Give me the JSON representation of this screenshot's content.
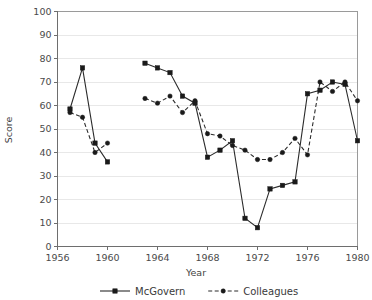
{
  "chart_data": {
    "type": "line",
    "title": "",
    "xlabel": "Year",
    "ylabel": "Score",
    "xlim": [
      1956,
      1980
    ],
    "ylim": [
      0,
      100
    ],
    "xticks": [
      1956,
      1960,
      1964,
      1968,
      1972,
      1976,
      1980
    ],
    "yticks": [
      0,
      10,
      20,
      30,
      40,
      50,
      60,
      70,
      80,
      90,
      100
    ],
    "grid": true,
    "legend_position": "bottom",
    "series": [
      {
        "name": "McGovern",
        "style": "solid",
        "marker": "square",
        "color": "#1a1a1a",
        "segments": [
          {
            "x": [
              1957,
              1958,
              1959,
              1960
            ],
            "y": [
              58.5,
              76,
              44,
              36
            ]
          },
          {
            "x": [
              1963,
              1964,
              1965,
              1966,
              1967,
              1968,
              1969,
              1970,
              1971,
              1972,
              1973,
              1974,
              1975,
              1976,
              1977,
              1978,
              1979,
              1980
            ],
            "y": [
              78,
              76,
              74,
              64,
              61,
              38,
              41,
              45,
              12,
              8,
              24.5,
              26,
              27.5,
              65,
              66.5,
              70,
              69,
              45
            ]
          }
        ]
      },
      {
        "name": "Colleagues",
        "style": "dashed",
        "marker": "circle",
        "color": "#1a1a1a",
        "segments": [
          {
            "x": [
              1957,
              1958,
              1959,
              1960
            ],
            "y": [
              57,
              55,
              40,
              44
            ]
          },
          {
            "x": [
              1963,
              1964,
              1965,
              1966,
              1967,
              1968,
              1969,
              1970,
              1971,
              1972,
              1973,
              1974,
              1975,
              1976,
              1977,
              1978,
              1979,
              1980
            ],
            "y": [
              63,
              61,
              64,
              57,
              62,
              48,
              47,
              43,
              41,
              37,
              37,
              40,
              46,
              39,
              70,
              66,
              70,
              62
            ]
          }
        ]
      }
    ]
  },
  "legend": {
    "items": [
      {
        "label": "McGovern"
      },
      {
        "label": "Colleagues"
      }
    ]
  },
  "axes": {
    "y_title": "Score",
    "x_title": "Year"
  }
}
